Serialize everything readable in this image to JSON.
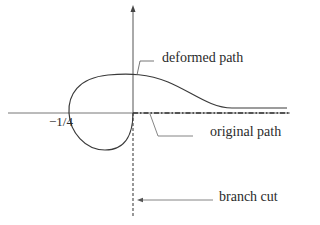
{
  "diagram": {
    "type": "contour-deformation",
    "labels": {
      "deformed_path": "deformed path",
      "original_path": "original path",
      "branch_cut": "branch cut",
      "point": "−1/4"
    },
    "colors": {
      "stroke": "#3a3a3a",
      "axis": "#555555",
      "leader": "#666666",
      "text": "#2a2a2a",
      "background": "#ffffff"
    }
  }
}
